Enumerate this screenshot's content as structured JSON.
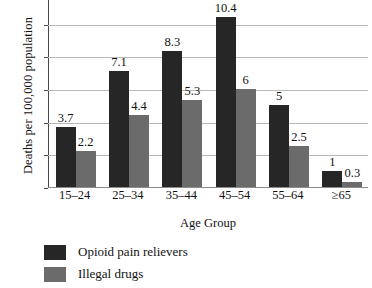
{
  "chart_data": {
    "type": "bar",
    "title": "",
    "subtitle": "",
    "xlabel": "Age Group",
    "ylabel": "Deaths per 100,000 population",
    "categories": [
      "15–24",
      "25–34",
      "35–44",
      "45–54",
      "55–64",
      "≥65"
    ],
    "series": [
      {
        "name": "Opioid pain relievers",
        "color": "#262626",
        "values": [
          3.7,
          7.1,
          8.3,
          10.4,
          5,
          1
        ],
        "labels": [
          "3.7",
          "7.1",
          "8.3",
          "10.4",
          "5",
          "1"
        ]
      },
      {
        "name": "Illegal drugs",
        "color": "#6b6b6b",
        "values": [
          2.2,
          4.4,
          5.3,
          6,
          2.5,
          0.3
        ],
        "labels": [
          "2.2",
          "4.4",
          "5.3",
          "6",
          "2.5",
          "0.3"
        ]
      }
    ],
    "ylim": [
      0,
      12
    ],
    "yticks": [
      0,
      2,
      4,
      6,
      8,
      10,
      12
    ],
    "ytick_labels": [
      "0",
      "2",
      "4",
      "6",
      "8",
      "10",
      "12"
    ],
    "grid": true,
    "grid_axis": "y",
    "legend_position": "bottom-left",
    "data_labels": true
  },
  "legend": {
    "items": [
      {
        "label": "Opioid pain relievers",
        "color": "#262626"
      },
      {
        "label": "Illegal drugs",
        "color": "#6b6b6b"
      }
    ]
  },
  "colors": {
    "series_dark": "#262626",
    "series_gray": "#6b6b6b",
    "gridline": "#b9b9b9",
    "axis": "#4a4a4a",
    "text": "#111111",
    "background": "#ffffff"
  }
}
